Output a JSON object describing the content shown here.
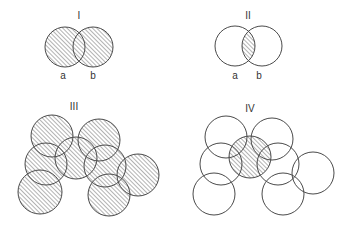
{
  "colors": {
    "stroke": "#4a4a4a",
    "hatch": "#8a8a8a",
    "background": "#ffffff",
    "text": "#333333"
  },
  "panels": [
    {
      "title": "I",
      "title_pos": [
        79,
        19
      ],
      "description": "Union of a and b shaded",
      "labels": [
        {
          "text": "a",
          "x": 63,
          "y": 79
        },
        {
          "text": "b",
          "x": 93,
          "y": 79
        }
      ],
      "circles": [
        {
          "cx": 65,
          "cy": 47,
          "r": 20
        },
        {
          "cx": 93,
          "cy": 47,
          "r": 20
        }
      ],
      "shading": "union"
    },
    {
      "title": "II",
      "title_pos": [
        248,
        19
      ],
      "description": "Intersection of a and b shaded",
      "labels": [
        {
          "text": "a",
          "x": 235,
          "y": 79
        },
        {
          "text": "b",
          "x": 259,
          "y": 79
        }
      ],
      "circles": [
        {
          "cx": 235,
          "cy": 46,
          "r": 20
        },
        {
          "cx": 262,
          "cy": 46,
          "r": 20
        }
      ],
      "shading": "intersection"
    },
    {
      "title": "III",
      "title_pos": [
        74,
        110
      ],
      "description": "Union of eight circles shaded",
      "labels": [],
      "circles": [
        {
          "cx": 52,
          "cy": 136,
          "r": 21
        },
        {
          "cx": 99,
          "cy": 140,
          "r": 21
        },
        {
          "cx": 76,
          "cy": 158,
          "r": 21
        },
        {
          "cx": 46,
          "cy": 164,
          "r": 21
        },
        {
          "cx": 105,
          "cy": 166,
          "r": 21
        },
        {
          "cx": 138,
          "cy": 175,
          "r": 21
        },
        {
          "cx": 40,
          "cy": 192,
          "r": 22
        },
        {
          "cx": 109,
          "cy": 195,
          "r": 21
        }
      ],
      "shading": "union"
    },
    {
      "title": "IV",
      "title_pos": [
        250,
        112
      ],
      "description": "Only the central circle shaded",
      "labels": [],
      "circles": [
        {
          "cx": 226,
          "cy": 137,
          "r": 21
        },
        {
          "cx": 272,
          "cy": 139,
          "r": 21
        },
        {
          "cx": 221,
          "cy": 164,
          "r": 21
        },
        {
          "cx": 278,
          "cy": 164,
          "r": 21
        },
        {
          "cx": 313,
          "cy": 173,
          "r": 21
        },
        {
          "cx": 214,
          "cy": 194,
          "r": 21
        },
        {
          "cx": 283,
          "cy": 194,
          "r": 21
        },
        {
          "cx": 250,
          "cy": 157,
          "r": 21
        }
      ],
      "shaded_index": 7,
      "shading": "single"
    }
  ]
}
